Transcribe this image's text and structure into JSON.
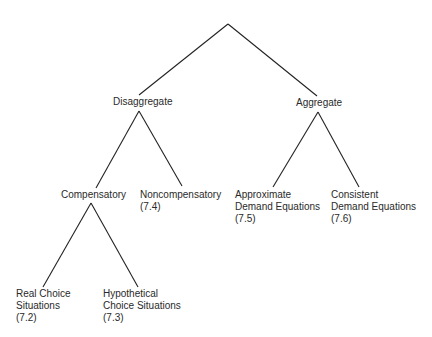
{
  "diagram": {
    "type": "tree",
    "line_color": "#222222",
    "text_color": "#2a2a2a",
    "nodes": {
      "root": {
        "label": ""
      },
      "disaggregate": {
        "label": "Disaggregate"
      },
      "aggregate": {
        "label": "Aggregate"
      },
      "compensatory": {
        "label": "Compensatory"
      },
      "noncompensatory": {
        "line1": "Noncompensatory",
        "line2": "(7.4)"
      },
      "approximate": {
        "line1": "Approximate",
        "line2": "Demand Equations",
        "line3": "(7.5)"
      },
      "consistent": {
        "line1": "Consistent",
        "line2": "Demand Equations",
        "line3": "(7.6)"
      },
      "real_choice": {
        "line1": "Real Choice",
        "line2": "Situations",
        "line3": "(7.2)"
      },
      "hypothetical_choice": {
        "line1": "Hypothetical",
        "line2": "Choice Situations",
        "line3": "(7.3)"
      }
    },
    "edges": [
      [
        "root",
        "disaggregate"
      ],
      [
        "root",
        "aggregate"
      ],
      [
        "disaggregate",
        "compensatory"
      ],
      [
        "disaggregate",
        "noncompensatory"
      ],
      [
        "aggregate",
        "approximate"
      ],
      [
        "aggregate",
        "consistent"
      ],
      [
        "compensatory",
        "real_choice"
      ],
      [
        "compensatory",
        "hypothetical_choice"
      ]
    ]
  }
}
